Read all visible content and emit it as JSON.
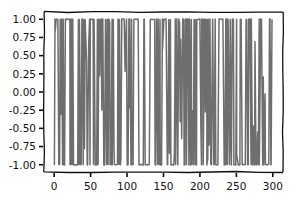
{
  "chart_data": {
    "type": "line",
    "title": "",
    "xlabel": "",
    "ylabel": "",
    "style": "xkcd",
    "xlim": [
      -14,
      314
    ],
    "ylim": [
      -1.1,
      1.1
    ],
    "x_ticks": [
      0,
      50,
      100,
      150,
      200,
      250,
      300
    ],
    "x_tick_labels": [
      "0",
      "50",
      "100",
      "150",
      "200",
      "250",
      "300"
    ],
    "y_ticks": [
      1.0,
      0.75,
      0.5,
      0.25,
      0.0,
      -0.25,
      -0.5,
      -0.75,
      -1.0
    ],
    "y_tick_labels": [
      "1.00",
      "0.75",
      "0.50",
      "0.25",
      "0.00",
      "-0.25",
      "-0.50",
      "-0.75",
      "-1.00"
    ],
    "grid": false,
    "legend": null,
    "series": [
      {
        "name": "signal",
        "color": "#6e6e6e",
        "x_range": [
          0,
          299
        ],
        "n_points": 300,
        "description": "Rapidly oscillating signal, values clustered near +1 and -1 (approx. sin of large integer argument / sign-like), with occasional intermediate values near 0",
        "values_min": -1.0,
        "values_max": 1.0,
        "seed": 7
      }
    ]
  },
  "colors": {
    "line": "#6e6e6e",
    "axes": "#111111",
    "background": "#ffffff"
  }
}
